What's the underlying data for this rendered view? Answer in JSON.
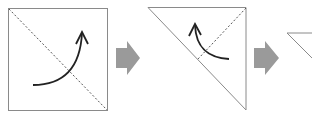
{
  "diagram": {
    "type": "origami-fold-steps",
    "colors": {
      "paper_outline": "#8a8a8a",
      "fold_line": "#555555",
      "curve_arrow": "#222222",
      "step_arrow": "#9a9a9a",
      "background": "#ffffff"
    },
    "steps": [
      {
        "label": "Step 1: square with diagonal fold line; fold bottom-left corner up to top-right"
      },
      {
        "label": "Step 2: resulting triangle with fold line; fold corner back"
      },
      {
        "label": "Step 3: next folded shape (partially visible)"
      }
    ],
    "arrows": [
      {
        "label": "next step arrow 1"
      },
      {
        "label": "next step arrow 2"
      }
    ]
  }
}
